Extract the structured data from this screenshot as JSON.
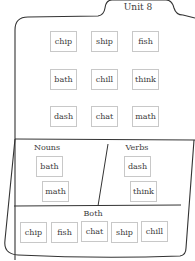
{
  "title": "Unit 8",
  "word_bank": {
    "rows": [
      [
        "chip",
        "ship",
        "fish"
      ],
      [
        "bath",
        "chill",
        "think"
      ],
      [
        "dash",
        "chat",
        "math"
      ]
    ]
  },
  "sort": {
    "nouns": {
      "label": "Nouns",
      "words": [
        "bath",
        "math"
      ]
    },
    "verbs": {
      "label": "Verbs",
      "words": [
        "dash",
        "think"
      ]
    },
    "both": {
      "label": "Both",
      "words": [
        "chip",
        "fish",
        "chat",
        "ship",
        "chill"
      ]
    }
  },
  "colors": {
    "line": "#333333",
    "card_border": "#c8c8c8",
    "text": "#3c3c3c"
  }
}
